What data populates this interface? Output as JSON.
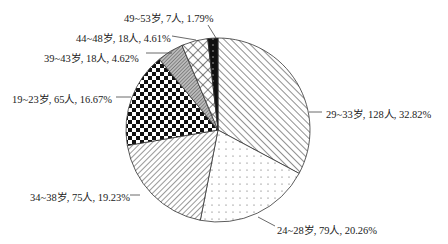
{
  "chart_data": {
    "type": "pie",
    "title": "",
    "start_angle_deg": 0,
    "direction": "clockwise",
    "slices": [
      {
        "label": "29~33岁",
        "count": 128,
        "percent": 32.82,
        "text": "29~33岁, 128人, 32.82%",
        "pattern": "diag-back"
      },
      {
        "label": "24~28岁",
        "count": 79,
        "percent": 20.26,
        "text": "24~28岁, 79人, 20.26%",
        "pattern": "dots"
      },
      {
        "label": "34~38岁",
        "count": 75,
        "percent": 19.23,
        "text": "34~38岁, 75人, 19.23%",
        "pattern": "diag-fwd"
      },
      {
        "label": "19~23岁",
        "count": 65,
        "percent": 16.67,
        "text": "19~23岁, 65人, 16.67%",
        "pattern": "checker"
      },
      {
        "label": "39~43岁",
        "count": 18,
        "percent": 4.62,
        "text": "39~43岁, 18人, 4.62%",
        "pattern": "dense-grey"
      },
      {
        "label": "44~48岁",
        "count": 18,
        "percent": 4.61,
        "text": "44~48岁, 18人, 4.61%",
        "pattern": "crosshatch"
      },
      {
        "label": "49~53岁",
        "count": 7,
        "percent": 1.79,
        "text": "49~53岁, 7人, 1.79%",
        "pattern": "black-dots"
      }
    ],
    "total": 390,
    "legend": "none (direct labels with leader lines)"
  },
  "labels": {
    "s0": "29~33岁, 128人, 32.82%",
    "s1": "24~28岁, 79人, 20.26%",
    "s2": "34~38岁, 75人, 19.23%",
    "s3": "19~23岁, 65人, 16.67%",
    "s4": "39~43岁, 18人, 4.62%",
    "s5": "44~48岁, 18人, 4.61%",
    "s6": "49~53岁, 7人, 1.79%"
  }
}
